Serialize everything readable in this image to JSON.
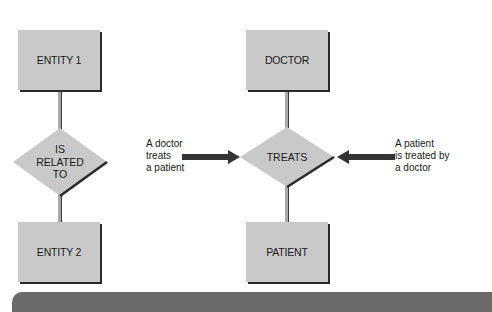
{
  "generic": {
    "entity1": "ENTITY 1",
    "relationship_lines": [
      "IS",
      "RELATED",
      "TO"
    ],
    "entity2": "ENTITY 2"
  },
  "example": {
    "entity1": "DOCTOR",
    "relationship": "TREATS",
    "entity2": "PATIENT"
  },
  "annotations": {
    "left_lines": [
      "A doctor",
      "treats",
      "a patient"
    ],
    "right_lines": [
      "A patient",
      "is treated by",
      "a doctor"
    ]
  },
  "colors": {
    "shape_fill": "#c9c9c9",
    "shadow": "#2a2a2a",
    "arrow": "#333333",
    "band": "#6a6a6a"
  }
}
